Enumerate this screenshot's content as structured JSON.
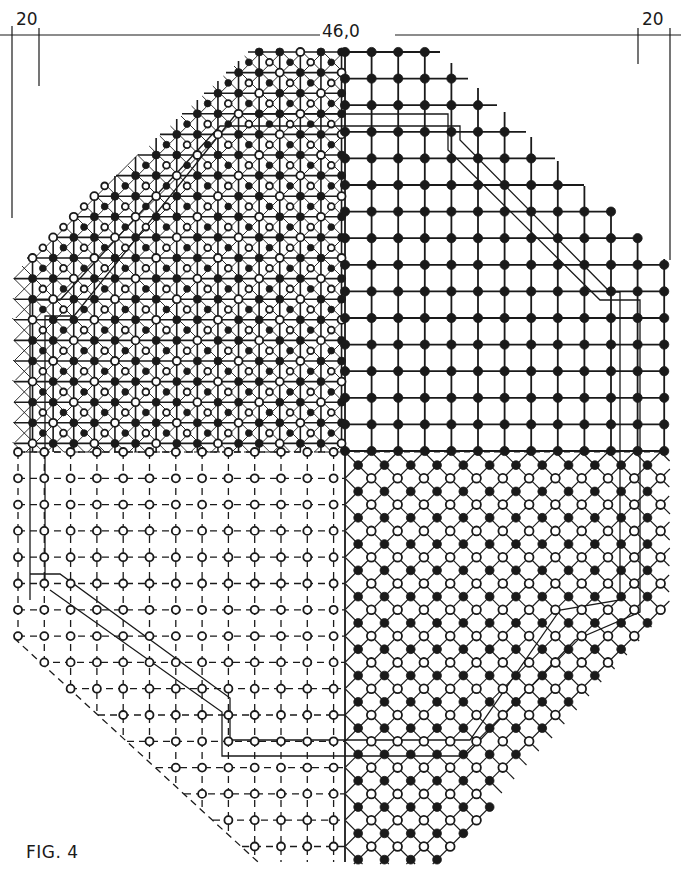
{
  "figure": {
    "caption": "FIG. 4",
    "dimensions": {
      "left_margin": "20",
      "overall_width": "46,0",
      "right_margin": "20"
    },
    "quadrants": [
      {
        "name": "upper-left",
        "pattern": "dense square grid with diagonal cross lines, alternating solid and hollow dots",
        "line_style": "solid"
      },
      {
        "name": "upper-right",
        "pattern": "coarse square grid, solid dots",
        "line_style": "solid"
      },
      {
        "name": "lower-left",
        "pattern": "square grid, hollow dots",
        "line_style": "dashed"
      },
      {
        "name": "lower-right",
        "pattern": "diagonal (45°) grid, alternating solid and hollow dots",
        "line_style": "solid-thin"
      }
    ],
    "colors": {
      "ink": "#1a1a1a",
      "paper": "#ffffff"
    }
  }
}
